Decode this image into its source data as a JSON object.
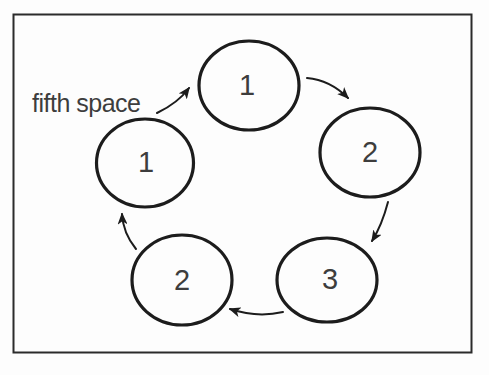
{
  "figure": {
    "type": "cycle-diagram",
    "annotation": "fifth space",
    "flow": "clockwise",
    "nodes": [
      {
        "position": "top",
        "label": "1"
      },
      {
        "position": "right",
        "label": "2"
      },
      {
        "position": "bottom-right",
        "label": "3"
      },
      {
        "position": "bottom-left",
        "label": "2"
      },
      {
        "position": "left",
        "label": "1"
      }
    ],
    "connections": [
      {
        "from": "annotation",
        "to": "top"
      },
      {
        "from": "top",
        "to": "right"
      },
      {
        "from": "right",
        "to": "bottom-right"
      },
      {
        "from": "bottom-right",
        "to": "bottom-left"
      },
      {
        "from": "bottom-left",
        "to": "left"
      }
    ],
    "colors": {
      "ink": "#1c1c1c",
      "frame": "#2b2b2b",
      "number": "#3d3d3d",
      "background": "#fdfdfd"
    }
  }
}
